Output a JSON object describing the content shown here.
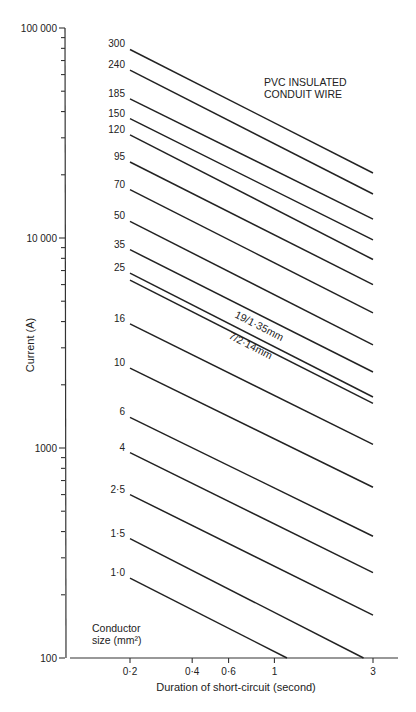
{
  "header_fragment": "",
  "caption": "",
  "chart_data": {
    "type": "line",
    "title_lines": [
      "PVC INSULATED",
      "CONDUIT WIRE"
    ],
    "xlabel": "Duration of short-circuit (second)",
    "ylabel": "Current (A)",
    "xscale": "log",
    "yscale": "log",
    "xlim": [
      0.1,
      4
    ],
    "ylim": [
      100,
      100000
    ],
    "x_ticks": [
      {
        "value": 0.2,
        "label": "0·2"
      },
      {
        "value": 0.4,
        "label": "0·4"
      },
      {
        "value": 0.6,
        "label": "0·6"
      },
      {
        "value": 1,
        "label": "1"
      },
      {
        "value": 3,
        "label": "3"
      }
    ],
    "y_ticks": [
      {
        "value": 100,
        "label": "100"
      },
      {
        "value": 1000,
        "label": "1000"
      },
      {
        "value": 10000,
        "label": "10 000"
      },
      {
        "value": 100000,
        "label": "100 000"
      }
    ],
    "legend_title_lines": [
      "Conductor",
      "size (mm²)"
    ],
    "grid": false,
    "annotations": [
      {
        "text": "19/1·35mm",
        "applies_to": "25 (upper line)"
      },
      {
        "text": "7/2·14mm",
        "applies_to": "25 (lower line)"
      }
    ],
    "series": [
      {
        "name": "300",
        "label": "300",
        "x": [
          0.2,
          3
        ],
        "y": [
          79000,
          20400
        ]
      },
      {
        "name": "240",
        "label": "240",
        "x": [
          0.2,
          3
        ],
        "y": [
          63000,
          16200
        ]
      },
      {
        "name": "185",
        "label": "185",
        "x": [
          0.2,
          3
        ],
        "y": [
          46000,
          12300
        ]
      },
      {
        "name": "150",
        "label": "150",
        "x": [
          0.2,
          3
        ],
        "y": [
          37000,
          9800
        ]
      },
      {
        "name": "120",
        "label": "120",
        "x": [
          0.2,
          3
        ],
        "y": [
          31000,
          7900
        ]
      },
      {
        "name": "95",
        "label": "95",
        "x": [
          0.2,
          3
        ],
        "y": [
          23000,
          6000
        ]
      },
      {
        "name": "70",
        "label": "70",
        "x": [
          0.2,
          3
        ],
        "y": [
          17000,
          4400
        ]
      },
      {
        "name": "50",
        "label": "50",
        "x": [
          0.2,
          3
        ],
        "y": [
          12000,
          3100
        ]
      },
      {
        "name": "35",
        "label": "35",
        "x": [
          0.2,
          3
        ],
        "y": [
          8800,
          2300
        ]
      },
      {
        "name": "25 (19/1·35mm)",
        "label": "25",
        "x": [
          0.2,
          3
        ],
        "y": [
          6800,
          1750
        ]
      },
      {
        "name": "25 (7/2·14mm)",
        "label": "",
        "x": [
          0.2,
          3
        ],
        "y": [
          6300,
          1630
        ]
      },
      {
        "name": "16",
        "label": "16",
        "x": [
          0.2,
          3
        ],
        "y": [
          3900,
          1040
        ]
      },
      {
        "name": "10",
        "label": "10",
        "x": [
          0.2,
          3
        ],
        "y": [
          2400,
          650
        ]
      },
      {
        "name": "6",
        "label": "6",
        "x": [
          0.2,
          3
        ],
        "y": [
          1400,
          380
        ]
      },
      {
        "name": "4",
        "label": "4",
        "x": [
          0.2,
          3
        ],
        "y": [
          950,
          255
        ]
      },
      {
        "name": "2·5",
        "label": "2·5",
        "x": [
          0.2,
          3
        ],
        "y": [
          600,
          160
        ]
      },
      {
        "name": "1·5",
        "label": "1·5",
        "x": [
          0.2,
          2.7
        ],
        "y": [
          370,
          100
        ]
      },
      {
        "name": "1·0",
        "label": "1·0",
        "x": [
          0.2,
          1.15
        ],
        "y": [
          240,
          100
        ]
      }
    ]
  }
}
